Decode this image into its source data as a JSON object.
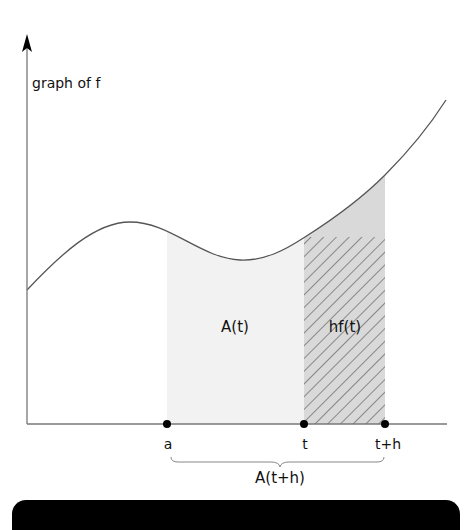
{
  "figure": {
    "y_axis_label": "graph of f",
    "region_labels": {
      "area_to_t": "A(t)",
      "strip": "hf(t)",
      "total_area": "A(t+h)"
    },
    "x_points": [
      {
        "label": "a",
        "x_px": 167
      },
      {
        "label": "t",
        "x_px": 304
      },
      {
        "label": "t+h",
        "x_px": 385
      }
    ],
    "colors": {
      "axis": "#777777",
      "curve": "#555555",
      "area_fill": "#f2f2f2",
      "strip_fill": "#d9d9d9",
      "hatch": "#444444",
      "point": "#000000",
      "bottom_bar": "#000000"
    }
  }
}
